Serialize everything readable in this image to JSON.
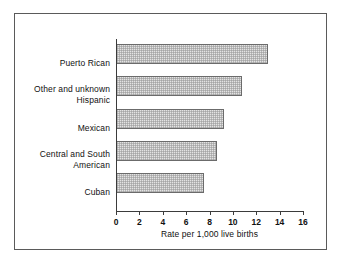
{
  "chart_data": {
    "type": "bar",
    "orientation": "horizontal",
    "title": "",
    "xlabel": "Rate per 1,000 live births",
    "ylabel": "",
    "xlim": [
      0,
      16
    ],
    "xticks": [
      "0",
      "2",
      "4",
      "6",
      "8",
      "10",
      "12",
      "14",
      "16"
    ],
    "grid": false,
    "legend": null,
    "categories": [
      "Puerto Rican",
      "Other and unknown Hispanic",
      "Mexican",
      "Central and South American",
      "Cuban"
    ],
    "category_lines": [
      [
        "Puerto Rican"
      ],
      [
        "Other and unknown",
        "Hispanic"
      ],
      [
        "Mexican"
      ],
      [
        "Central and South",
        "American"
      ],
      [
        "Cuban"
      ]
    ],
    "values": [
      13.0,
      10.8,
      9.2,
      8.6,
      7.5
    ],
    "bar_fill_color": "#e3e3e3",
    "bar_edge_color": "#6b6b6b",
    "frame_color": "#5a5a5a",
    "axis_color": "#3b3b3b"
  }
}
